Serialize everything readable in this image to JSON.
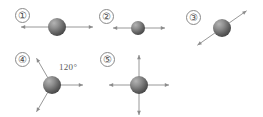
{
  "figure": {
    "background_color": "#ffffff",
    "width": 263,
    "height": 117,
    "arrow_color": "#8c8c8c",
    "sphere_color_light": "#9a9a9a",
    "sphere_color_dark": "#4a4a4a",
    "label_color": "#4a4a4a",
    "diagrams": [
      {
        "id": "diagram-1",
        "numeral": "①",
        "numeral_x": 15,
        "numeral_y": 8,
        "sphere_cx": 57,
        "sphere_cy": 27,
        "sphere_r": 9,
        "arrows": [
          {
            "name": "arrow-left",
            "angle_deg": 180,
            "length": 36
          },
          {
            "name": "arrow-right",
            "angle_deg": 0,
            "length": 36
          }
        ],
        "angle_label": null
      },
      {
        "id": "diagram-2",
        "numeral": "②",
        "numeral_x": 99,
        "numeral_y": 9,
        "sphere_cx": 138,
        "sphere_cy": 28,
        "sphere_r": 7,
        "arrows": [
          {
            "name": "arrow-left",
            "angle_deg": 180,
            "length": 25
          },
          {
            "name": "arrow-right",
            "angle_deg": 0,
            "length": 27
          }
        ],
        "angle_label": null
      },
      {
        "id": "diagram-3",
        "numeral": "③",
        "numeral_x": 186,
        "numeral_y": 10,
        "sphere_cx": 222,
        "sphere_cy": 28,
        "sphere_r": 9,
        "arrows": [
          {
            "name": "arrow-up-right",
            "angle_deg": -35,
            "length": 30
          },
          {
            "name": "arrow-down-left",
            "angle_deg": 145,
            "length": 30
          }
        ],
        "angle_label": null
      },
      {
        "id": "diagram-4",
        "numeral": "④",
        "numeral_x": 15,
        "numeral_y": 52,
        "sphere_cx": 52,
        "sphere_cy": 85,
        "sphere_r": 9,
        "arrows": [
          {
            "name": "arrow-right",
            "angle_deg": 0,
            "length": 31
          },
          {
            "name": "arrow-up-left",
            "angle_deg": -120,
            "length": 31
          },
          {
            "name": "arrow-down-left",
            "angle_deg": 120,
            "length": 31
          }
        ],
        "angle_label": {
          "text": "120°",
          "x": 59,
          "y": 62
        }
      },
      {
        "id": "diagram-5",
        "numeral": "⑤",
        "numeral_x": 100,
        "numeral_y": 52,
        "sphere_cx": 139,
        "sphere_cy": 85,
        "sphere_r": 9,
        "arrows": [
          {
            "name": "arrow-up",
            "angle_deg": -90,
            "length": 30
          },
          {
            "name": "arrow-down",
            "angle_deg": 90,
            "length": 30
          },
          {
            "name": "arrow-left",
            "angle_deg": 180,
            "length": 30
          },
          {
            "name": "arrow-right",
            "angle_deg": 0,
            "length": 30
          }
        ],
        "angle_label": null
      }
    ]
  }
}
